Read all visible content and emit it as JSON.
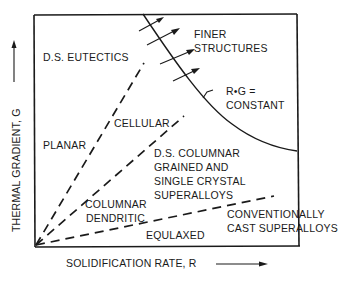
{
  "figure": {
    "type": "solidification-map",
    "y_axis": {
      "label": "THERMAL GRADIENT, G",
      "arrow": "up-arrow"
    },
    "x_axis": {
      "label": "SOLIDIFICATION RATE, R",
      "arrow": "right-arrow"
    },
    "regions": [
      {
        "id": "ds-eutectics",
        "label_lines": [
          "D.S. EUTECTICS"
        ]
      },
      {
        "id": "planar",
        "label_lines": [
          "PLANAR"
        ]
      },
      {
        "id": "cellular",
        "label_lines": [
          "CELLULAR"
        ]
      },
      {
        "id": "columnar-dendritic",
        "label_lines": [
          "COLUMNAR",
          "DENDRITIC"
        ]
      },
      {
        "id": "equiaxed",
        "label_lines": [
          "EQULAXED"
        ]
      },
      {
        "id": "ds-columnar",
        "label_lines": [
          "D.S. COLUMNAR",
          "GRAINED AND",
          "SINGLE CRYSTAL",
          "SUPERALLOYS"
        ]
      },
      {
        "id": "conventionally-cast",
        "label_lines": [
          "CONVENTIONALLY",
          "CAST SUPERALLOYS"
        ]
      }
    ],
    "annotations": {
      "finer_structures": [
        "FINER",
        "STRUCTURES"
      ],
      "constant_curve": [
        "R•G =",
        "CONSTANT"
      ]
    },
    "boundaries": [
      {
        "name": "planar-cellular",
        "style": "dashed"
      },
      {
        "name": "cellular-columnar",
        "style": "dashed"
      },
      {
        "name": "columnar-equiaxed",
        "style": "dashed"
      },
      {
        "name": "rg-constant",
        "style": "solid-curve"
      }
    ]
  }
}
